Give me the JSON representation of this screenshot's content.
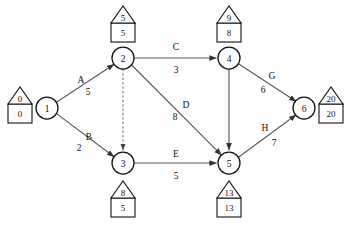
{
  "diagram": {
    "type": "pert-cpm-network",
    "colors": {
      "background": "#ffffff",
      "edge": "#5a5a5a",
      "dummy_edge": "#6a6a6a",
      "node_stroke": "#111111",
      "text": "#111111"
    },
    "nodes": [
      {
        "id": "1",
        "label": "1",
        "cx": 47,
        "cy": 108,
        "r": 11,
        "tag": {
          "top": "0",
          "bottom": "0",
          "position": "left"
        }
      },
      {
        "id": "2",
        "label": "2",
        "cx": 123,
        "cy": 58,
        "r": 11,
        "tag": {
          "top": "5",
          "bottom": "5",
          "position": "above"
        }
      },
      {
        "id": "3",
        "label": "3",
        "cx": 123,
        "cy": 163,
        "r": 11,
        "tag": {
          "top": "8",
          "bottom": "5",
          "position": "below"
        }
      },
      {
        "id": "4",
        "label": "4",
        "cx": 229,
        "cy": 58,
        "r": 11,
        "tag": {
          "top": "9",
          "bottom": "8",
          "position": "above"
        }
      },
      {
        "id": "5",
        "label": "5",
        "cx": 229,
        "cy": 163,
        "r": 11,
        "tag": {
          "top": "13",
          "bottom": "13",
          "position": "below"
        }
      },
      {
        "id": "6",
        "label": "6",
        "cx": 304,
        "cy": 108,
        "r": 11,
        "tag": {
          "top": "20",
          "bottom": "20",
          "position": "right"
        }
      }
    ],
    "edges": [
      {
        "id": "A",
        "from": "1",
        "to": "2",
        "activity": "A",
        "duration": "5",
        "style": "solid",
        "letter_x": 81,
        "letter_y": 80,
        "dur_x": 88,
        "dur_y": 92
      },
      {
        "id": "B",
        "from": "1",
        "to": "3",
        "activity": "B",
        "duration": "2",
        "style": "solid",
        "letter_x": 89,
        "letter_y": 137,
        "dur_x": 79,
        "dur_y": 148
      },
      {
        "id": "C",
        "from": "2",
        "to": "4",
        "activity": "C",
        "duration": "3",
        "style": "solid",
        "letter_x": 176,
        "letter_y": 47,
        "dur_x": 176,
        "dur_y": 70
      },
      {
        "id": "D",
        "from": "2",
        "to": "5",
        "activity": "D",
        "duration": "8",
        "style": "solid",
        "letter_x": 186,
        "letter_y": 105,
        "dur_x": 175,
        "dur_y": 117
      },
      {
        "id": "E",
        "from": "3",
        "to": "5",
        "activity": "E",
        "duration": "5",
        "style": "solid",
        "letter_x": 176,
        "letter_y": 154,
        "dur_x": 176,
        "dur_y": 176
      },
      {
        "id": "F",
        "from": "4",
        "to": "5",
        "activity": "",
        "duration": "",
        "style": "solid",
        "letter_x": 0,
        "letter_y": 0,
        "dur_x": 0,
        "dur_y": 0
      },
      {
        "id": "G",
        "from": "4",
        "to": "6",
        "activity": "G",
        "duration": "6",
        "style": "solid",
        "letter_x": 272,
        "letter_y": 76,
        "dur_x": 263,
        "dur_y": 90
      },
      {
        "id": "H",
        "from": "5",
        "to": "6",
        "activity": "H",
        "duration": "7",
        "style": "solid",
        "letter_x": 265,
        "letter_y": 128,
        "dur_x": 274,
        "dur_y": 143
      },
      {
        "id": "dummy",
        "from": "2",
        "to": "3",
        "activity": "",
        "duration": "",
        "style": "dashed",
        "letter_x": 0,
        "letter_y": 0,
        "dur_x": 0,
        "dur_y": 0
      }
    ]
  }
}
